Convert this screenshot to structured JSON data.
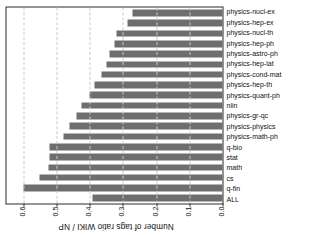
{
  "chart_data": {
    "type": "bar",
    "title": "",
    "subtitle": "",
    "xlabel": "",
    "ylabel": "Number of tags ratio WIKI / NP",
    "ylim": [
      0.0,
      0.65
    ],
    "yticks": [
      0.0,
      0.1,
      0.2,
      0.3,
      0.4,
      0.5,
      0.6
    ],
    "ytick_labels": [
      "0.0",
      "0.1",
      "0.2",
      "0.3",
      "0.4",
      "0.5",
      "0.6"
    ],
    "grid": true,
    "legend": null,
    "bar_color": "#6e6e6e",
    "categories": [
      "ALL",
      "q-fin",
      "cs",
      "math",
      "stat",
      "q-bio",
      "physics-math-ph",
      "physics-physics",
      "physics-gr-qc",
      "nlin",
      "physics-quant-ph",
      "physics-hep-th",
      "physics-cond-mat",
      "physics-hep-lat",
      "physics-astro-ph",
      "physics-hep-ph",
      "physics-nucl-th",
      "physics-hep-ex",
      "physics-nucl-ex"
    ],
    "values": [
      0.39,
      0.6,
      0.55,
      0.525,
      0.52,
      0.52,
      0.48,
      0.46,
      0.44,
      0.425,
      0.4,
      0.385,
      0.365,
      0.35,
      0.34,
      0.325,
      0.32,
      0.285,
      0.27
    ]
  }
}
